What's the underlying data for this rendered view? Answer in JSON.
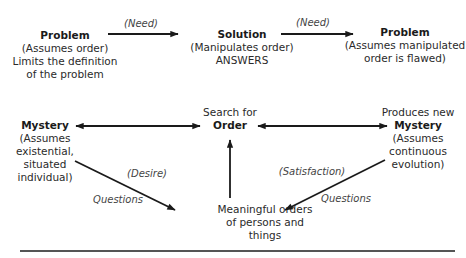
{
  "nodes": {
    "problem_1": {
      "title": "Problem",
      "lines": [
        "(Assumes order)",
        "Limits the definition",
        "of the problem"
      ]
    },
    "solution": {
      "title": "Solution",
      "lines": [
        "(Manipulates order)",
        "ANSWERS"
      ]
    },
    "problem_2": {
      "title": "Problem",
      "lines": [
        "(Assumes manipulated",
        "order is flawed)"
      ]
    },
    "mystery_1": {
      "title": "Mystery",
      "lines": [
        "(Assumes",
        "existential,",
        "situated",
        "individual)"
      ]
    },
    "search_order": {
      "pre": "Search for",
      "title": "Order"
    },
    "mystery_2": {
      "pre": "Produces new",
      "title": "Mystery",
      "lines": [
        "(Assumes",
        "continuous",
        "evolution)"
      ]
    },
    "meaningful": {
      "lines": [
        "Meaningful orders",
        "of persons and",
        "things"
      ]
    }
  },
  "edge_labels": {
    "need_1": "(Need)",
    "need_2": "(Need)",
    "desire": "(Desire)",
    "questions_1": "Questions",
    "satisfaction": "(Satisfaction)",
    "questions_2": "Questions"
  },
  "edges": [
    {
      "from": "problem_1",
      "to": "solution",
      "label": "need_1",
      "type": "directed"
    },
    {
      "from": "solution",
      "to": "problem_2",
      "label": "need_2",
      "type": "directed"
    },
    {
      "from": "mystery_1",
      "to": "search_order",
      "type": "bidirectional"
    },
    {
      "from": "search_order",
      "to": "mystery_2",
      "type": "bidirectional"
    },
    {
      "from": "meaningful",
      "to": "search_order",
      "type": "directed"
    },
    {
      "from": "mystery_1",
      "to": "meaningful",
      "label": "desire",
      "type": "directed"
    },
    {
      "from": "mystery_2",
      "to": "meaningful",
      "label": "satisfaction",
      "type": "directed"
    }
  ],
  "colors": {
    "ink": "#1a1a1a",
    "text": "#2a2a2a",
    "rule": "#555555"
  }
}
